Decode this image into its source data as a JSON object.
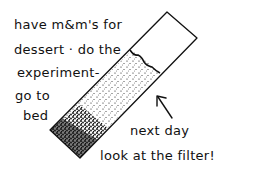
{
  "notes": {
    "line1": "have m&m's for",
    "line2": "dessert · do the",
    "line3": "experiment-",
    "line4": "go to",
    "line5": "bed",
    "callout1": "next day",
    "callout2": "look at the filter!"
  },
  "illustration": {
    "subject": "filter-paper-strip",
    "stain_color": "#111111",
    "paper_color": "#ffffff",
    "ink_color": "#111111"
  }
}
